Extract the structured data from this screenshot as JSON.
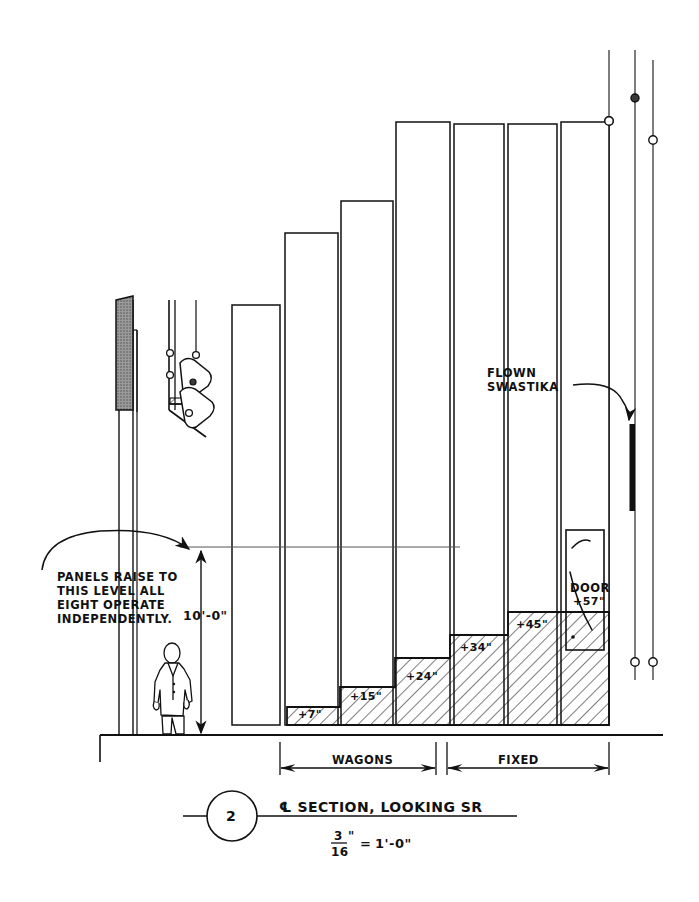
{
  "drawing": {
    "kind": "hand-drafted architectural section",
    "sheet_bg": "#ffffff",
    "ink": "#111111",
    "panel_gray": "#8a8a8a"
  },
  "title_block": {
    "detail_number": "2",
    "title": "℄ SECTION, LOOKING SR",
    "scale": {
      "numerator": "3",
      "denominator": "16",
      "inch_mark": "\"",
      "equals": "=",
      "equals_value": "1'-0\""
    }
  },
  "annotations": {
    "panels_note": {
      "line1": "PANELS RAISE TO",
      "line2": "THIS LEVEL ALL",
      "line3": "EIGHT OPERATE",
      "line4": "INDEPENDENTLY."
    },
    "flown": {
      "line1": "FLOWN",
      "line2": "SWASTIKA"
    },
    "door_label": "DOOR",
    "height_dimension": "10'-0\""
  },
  "platform_steps": [
    {
      "label": "+7\"",
      "height_in": 7
    },
    {
      "label": "+15\"",
      "height_in": 15
    },
    {
      "label": "+24\"",
      "height_in": 24
    },
    {
      "label": "+34\"",
      "height_in": 34
    },
    {
      "label": "+45\"",
      "height_in": 45
    },
    {
      "label": "+57\"",
      "height_in": 57
    }
  ],
  "dimension_strings": [
    {
      "label": "WAGONS"
    },
    {
      "label": "FIXED"
    }
  ]
}
